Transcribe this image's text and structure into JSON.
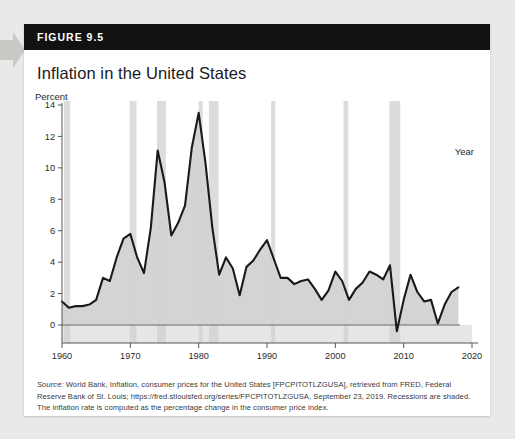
{
  "figure": {
    "header_label": "FIGURE 9.5",
    "title": "Inflation in the United States"
  },
  "axes": {
    "y_axis_title": "Percent",
    "x_axis_title": "Year"
  },
  "source": {
    "source_word": "Source:",
    "text": " World Bank, Inflation, consumer prices for the United States [FPCPITOTLZGUSA], retrieved from FRED, Federal Reserve Bank of St. Louis; https://fred.stlouisfed.org/series/FPCPITOTLZGUSA, September 23, 2019. Recessions are shaded. The inflation rate is computed as the percentage change in the consumer price index."
  },
  "colors": {
    "header_bg": "#121212",
    "card_bg": "#ffffff",
    "page_bg": "#e9e9e7",
    "line": "#1a1a1a",
    "area_fill": "#d2d2d2",
    "recession_band": "#dcdcdc",
    "axis": "#555555"
  },
  "ghost_text": {
    "line1": "",
    "line2": "",
    "line3": ""
  },
  "chart_data": {
    "type": "area",
    "title": "Inflation in the United States",
    "xlabel": "Year",
    "ylabel": "Percent",
    "xlim": [
      1960,
      2020
    ],
    "ylim": [
      -1,
      14
    ],
    "xticks": [
      1960,
      1970,
      1980,
      1990,
      2000,
      2010,
      2020
    ],
    "yticks": [
      0,
      2,
      4,
      6,
      8,
      10,
      12,
      14
    ],
    "grid": false,
    "legend": null,
    "series": [
      {
        "name": "Inflation rate (CPI, annual % change)",
        "x": [
          1960,
          1961,
          1962,
          1963,
          1964,
          1965,
          1966,
          1967,
          1968,
          1969,
          1970,
          1971,
          1972,
          1973,
          1974,
          1975,
          1976,
          1977,
          1978,
          1979,
          1980,
          1981,
          1982,
          1983,
          1984,
          1985,
          1986,
          1987,
          1988,
          1989,
          1990,
          1991,
          1992,
          1993,
          1994,
          1995,
          1996,
          1997,
          1998,
          1999,
          2000,
          2001,
          2002,
          2003,
          2004,
          2005,
          2006,
          2007,
          2008,
          2009,
          2010,
          2011,
          2012,
          2013,
          2014,
          2015,
          2016,
          2017,
          2018
        ],
        "values": [
          1.5,
          1.1,
          1.2,
          1.2,
          1.3,
          1.6,
          3.0,
          2.8,
          4.3,
          5.5,
          5.8,
          4.3,
          3.3,
          6.2,
          11.1,
          9.1,
          5.7,
          6.5,
          7.6,
          11.3,
          13.5,
          10.3,
          6.2,
          3.2,
          4.3,
          3.6,
          1.9,
          3.7,
          4.1,
          4.8,
          5.4,
          4.2,
          3.0,
          3.0,
          2.6,
          2.8,
          2.9,
          2.3,
          1.6,
          2.2,
          3.4,
          2.8,
          1.6,
          2.3,
          2.7,
          3.4,
          3.2,
          2.9,
          3.8,
          -0.4,
          1.6,
          3.2,
          2.1,
          1.5,
          1.6,
          0.1,
          1.3,
          2.1,
          2.4
        ]
      }
    ],
    "recessions": [
      {
        "start": 1960.3,
        "end": 1961.2
      },
      {
        "start": 1969.9,
        "end": 1970.9
      },
      {
        "start": 1973.9,
        "end": 1975.2
      },
      {
        "start": 1980.0,
        "end": 1980.6
      },
      {
        "start": 1981.5,
        "end": 1982.9
      },
      {
        "start": 1990.6,
        "end": 1991.2
      },
      {
        "start": 2001.2,
        "end": 2001.9
      },
      {
        "start": 2007.9,
        "end": 2009.5
      }
    ],
    "zero_line": 0
  }
}
